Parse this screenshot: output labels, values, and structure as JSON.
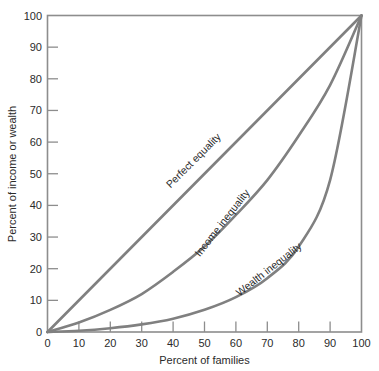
{
  "chart_data": {
    "type": "line",
    "title": "",
    "xlabel": "Percent of families",
    "ylabel": "Percent of income or wealth",
    "xlim": [
      0,
      100
    ],
    "ylim": [
      0,
      100
    ],
    "xticks": [
      0,
      10,
      20,
      30,
      40,
      50,
      60,
      70,
      80,
      90,
      100
    ],
    "yticks": [
      0,
      10,
      20,
      30,
      40,
      50,
      60,
      70,
      80,
      90,
      100
    ],
    "grid": false,
    "legend": "inline-curve-labels",
    "line_color": "#808080",
    "x": [
      0,
      10,
      20,
      30,
      40,
      50,
      60,
      70,
      80,
      90,
      100
    ],
    "series": [
      {
        "name": "Perfect equality",
        "label": "Perfect equality",
        "values": [
          0,
          10,
          20,
          30,
          40,
          50,
          60,
          70,
          80,
          90,
          100
        ]
      },
      {
        "name": "Income inequality",
        "label": "Income inequality",
        "values": [
          0,
          3,
          7,
          12,
          19,
          27,
          37,
          48,
          62,
          78,
          100
        ]
      },
      {
        "name": "Wealth inequality",
        "label": "Wealth inequality",
        "values": [
          0,
          0.4,
          1.2,
          2.4,
          4.2,
          7,
          11,
          17,
          27,
          48,
          100
        ]
      }
    ]
  },
  "labels": {
    "tick_0": "0",
    "tick_10": "10",
    "tick_20": "20",
    "tick_30": "30",
    "tick_40": "40",
    "tick_50": "50",
    "tick_60": "60",
    "tick_70": "70",
    "tick_80": "80",
    "tick_90": "90",
    "tick_100": "100"
  }
}
